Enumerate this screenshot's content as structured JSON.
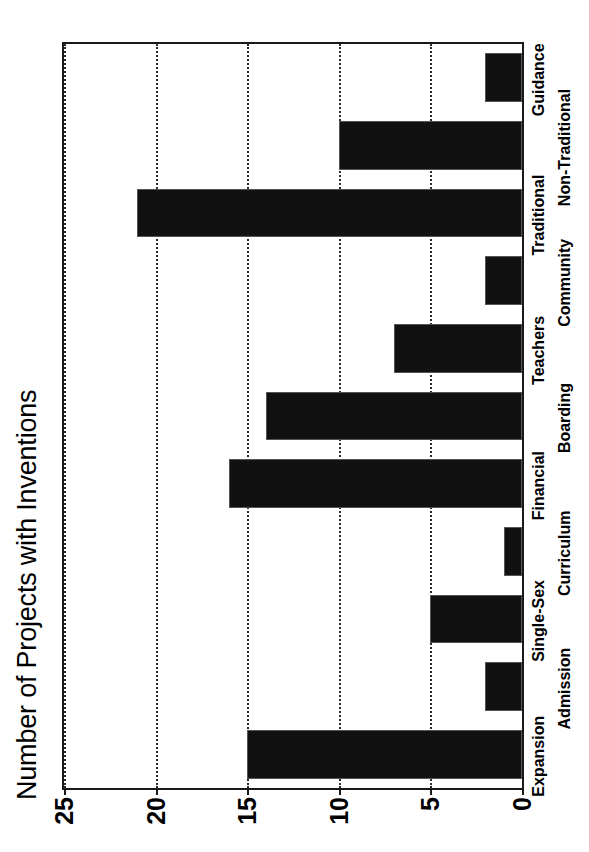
{
  "chart_data": {
    "type": "bar",
    "orientation": "vertical-rendered-rotated",
    "title": "Number of Projects with Inventions",
    "xlabel": "",
    "ylabel": "",
    "categories": [
      "Expansion",
      "Admission",
      "Single-Sex",
      "Curriculum",
      "Financial",
      "Boarding",
      "Teachers",
      "Community",
      "Traditional",
      "Non-Traditional",
      "Guidance"
    ],
    "values": [
      15,
      2,
      5,
      1,
      16,
      14,
      7,
      2,
      21,
      10,
      2
    ],
    "ylim": [
      0,
      25
    ],
    "yticks": [
      0,
      5,
      10,
      15,
      20,
      25
    ],
    "ytick_labels": [
      "0",
      "5",
      "10",
      "15",
      "20",
      "25"
    ],
    "grid": "dotted-vertical-at-value-ticks",
    "legend": "none",
    "bar_color": "#111111",
    "bar_edge_color": "#555555",
    "axis_color": "#1a1a1a",
    "background": "#ffffff"
  }
}
